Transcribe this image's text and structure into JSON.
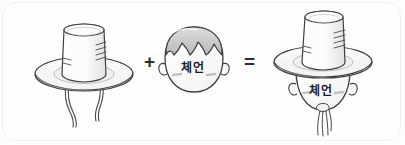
{
  "illustration": {
    "title": "che-eon hat equation",
    "description": "Korean grammar mnemonic: traditional gat hat plus a face labeled che-eon equals the face wearing the hat",
    "style": {
      "background": "#fdfdfd",
      "frame_border": "#f0f0f0",
      "ink": "#3a3a3a",
      "hat_fill": "#fafafa",
      "hat_shade": "#e4e4e4",
      "hair_fill": "#d6d6d6",
      "hair_shade": "#bdbdbd",
      "face_fill": "#fcfcfc",
      "blush": "#c9c9c9",
      "text_color": "#1d1d1d"
    }
  },
  "operators": {
    "plus": "+",
    "equals": "="
  },
  "terms": [
    {
      "index": 0,
      "name": "gat-hat",
      "label": "",
      "parts": [
        "crown-cylinder",
        "brim-ellipse",
        "chin-strap-left",
        "chin-strap-right"
      ]
    },
    {
      "index": 1,
      "name": "face",
      "label": "체언",
      "parts": [
        "head-outline",
        "hair",
        "ear-left",
        "ear-right",
        "blush-left",
        "blush-right"
      ]
    },
    {
      "index": 2,
      "name": "face-wearing-hat",
      "label": "체언",
      "parts": [
        "crown-cylinder",
        "brim-ellipse",
        "head-outline",
        "ear-left",
        "ear-right",
        "blush-left",
        "blush-right",
        "strap-knot",
        "strap-ribbons"
      ]
    }
  ],
  "labels": {
    "face_text": "체언",
    "result_text": "체언"
  }
}
